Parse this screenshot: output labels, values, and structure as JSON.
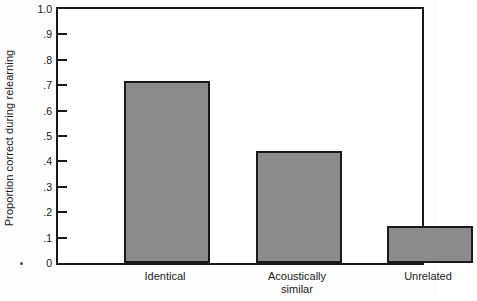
{
  "chart_data": {
    "type": "bar",
    "title": "",
    "subtitle": "",
    "xlabel": "",
    "ylabel": "Proportion correct during relearning",
    "categories": [
      "Identical",
      "Acoustically similar",
      "Unrelated"
    ],
    "category_lines": [
      [
        "Identical"
      ],
      [
        "Acoustically",
        "similar"
      ],
      [
        "Unrelated"
      ]
    ],
    "values": [
      0.715,
      0.44,
      0.145
    ],
    "ylim": [
      0,
      1.0
    ],
    "ytick_values": [
      0,
      0.1,
      0.2,
      0.3,
      0.4,
      0.5,
      0.6,
      0.7,
      0.8,
      0.9,
      1.0
    ],
    "ytick_labels": [
      "0",
      ".1",
      ".2",
      ".3",
      ".4",
      ".5",
      ".6",
      ".7",
      ".8",
      ".9",
      "1.0"
    ],
    "grid": false,
    "legend": null,
    "legend_position": "none",
    "bar_fill_color": "#8b8b8b",
    "bar_edge_color": "#1a1a1a",
    "axis_color": "#1a1a1a",
    "background_color": "#ffffff"
  },
  "axis": {
    "y_title": "Proportion correct during relearning"
  }
}
